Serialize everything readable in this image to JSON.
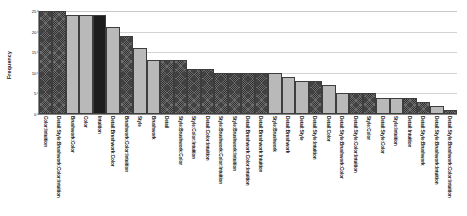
{
  "chart_data": {
    "type": "bar",
    "title": "",
    "subtitle": "",
    "xlabel": "",
    "ylabel": "Frequency",
    "ylim": [
      0,
      25
    ],
    "yticks": [
      0,
      5,
      10,
      15,
      20,
      25
    ],
    "ytick_labels": [
      "0",
      "5",
      "10",
      "15",
      "20",
      "25"
    ],
    "grid": true,
    "legend": "none",
    "orientation": "vertical",
    "categories": [
      "Color:Intuition",
      "Detail:Style:Brushwork:Color:Intuition",
      "Brushwork:Color",
      "Color",
      "Intuition",
      "Detail:Brushwork:Color",
      "Brushwork:Color:Intuition",
      "Style",
      "Brushwork",
      "Detail",
      "Style:Brushwork:Color",
      "Style:Color:Intuition",
      "Detail:Color:Intuition",
      "Style:Brushwork:Color:Intuition",
      "Style:Brushwork:Intuition",
      "Detail:Brushwork:Color:Intuition",
      "Detail:Brushwork:Intuition",
      "Style:Brushwork",
      "Detail:Brushwork",
      "Detail:Style",
      "Detail:Style:Intuition",
      "Detail:Color",
      "Detail:Style:Brushwork:Color",
      "Detail:Style:Color:Intuition",
      "Style:Color",
      "Detail:Style:Color",
      "Style:Intuition",
      "Detail:Intuition",
      "Detail:Style:Brushwork",
      "Detail:Style:Brushwork:Intuition",
      "Detail:Style:Brushwork:Color:Intuition"
    ],
    "values": [
      25,
      25,
      24,
      24,
      24,
      21,
      19,
      16,
      13,
      13,
      13,
      11,
      11,
      10,
      10,
      10,
      10,
      10,
      9,
      8,
      8,
      7,
      5,
      5,
      5,
      4,
      4,
      4,
      3,
      2,
      1
    ],
    "bar_fills": [
      "dark",
      "dark",
      "light",
      "light",
      "black",
      "light",
      "dark",
      "light",
      "light",
      "dark",
      "dark",
      "dark",
      "dark",
      "dark",
      "dark",
      "dark",
      "dark",
      "light",
      "light",
      "light",
      "dark",
      "light",
      "light",
      "dark",
      "dark",
      "light",
      "light",
      "dark",
      "dark",
      "light",
      "dark"
    ],
    "colors": {
      "light": "#b9b9b9",
      "dark": "#6d6d6d",
      "black": "#1d1d1d",
      "bar_outline": "#3d3d3d",
      "axis": "#8a8a8a",
      "gridline": "#d2d2d2",
      "background": "#ffffff"
    }
  }
}
